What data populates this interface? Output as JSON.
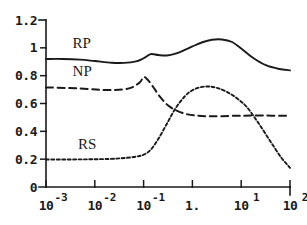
{
  "chart_data": {
    "type": "line",
    "title": "",
    "xlabel": "",
    "ylabel": "",
    "xscale": "log",
    "xlim": [
      0.001,
      100
    ],
    "ylim": [
      0,
      1.2
    ],
    "grid": false,
    "legend_position": "inline-labels",
    "y_ticks": [
      "0",
      "0.2",
      "0.4",
      "0.6",
      "0.8",
      "1",
      "1.2"
    ],
    "y_tick_values": [
      0,
      0.2,
      0.4,
      0.6,
      0.8,
      1,
      1.2
    ],
    "x_ticks": [
      {
        "base": "10",
        "exponent": "-3",
        "value": 0.001
      },
      {
        "base": "10",
        "exponent": "-2",
        "value": 0.01
      },
      {
        "base": "10",
        "exponent": "-1",
        "value": 0.1
      },
      {
        "base": "1.",
        "exponent": "",
        "value": 1
      },
      {
        "base": "10",
        "exponent": "1",
        "value": 10
      },
      {
        "base": "10",
        "exponent": "2",
        "value": 100
      }
    ],
    "series": [
      {
        "name": "RP",
        "style": "solid",
        "label_x": 0.0035,
        "label_y": 1.0,
        "x": [
          0.001,
          0.0022,
          0.005,
          0.01,
          0.022,
          0.04,
          0.07,
          0.1,
          0.14,
          0.2,
          0.3,
          0.45,
          0.7,
          1.0,
          1.6,
          2.5,
          4.0,
          6.5,
          10,
          18,
          32,
          60,
          100
        ],
        "values": [
          0.92,
          0.92,
          0.915,
          0.905,
          0.893,
          0.892,
          0.903,
          0.925,
          0.955,
          0.948,
          0.945,
          0.958,
          0.985,
          1.01,
          1.04,
          1.058,
          1.06,
          1.042,
          0.995,
          0.925,
          0.875,
          0.848,
          0.838
        ]
      },
      {
        "name": "NP",
        "style": "long-dashed",
        "label_x": 0.0035,
        "label_y": 0.8,
        "x": [
          0.001,
          0.0025,
          0.006,
          0.013,
          0.025,
          0.04,
          0.06,
          0.085,
          0.1,
          0.12,
          0.16,
          0.22,
          0.32,
          0.5,
          0.8,
          1.3,
          2.2,
          4.0,
          8.0,
          16,
          35,
          70,
          100
        ],
        "values": [
          0.715,
          0.712,
          0.706,
          0.698,
          0.697,
          0.702,
          0.718,
          0.755,
          0.79,
          0.772,
          0.715,
          0.645,
          0.585,
          0.545,
          0.522,
          0.512,
          0.508,
          0.509,
          0.512,
          0.513,
          0.513,
          0.512,
          0.512
        ]
      },
      {
        "name": "RS",
        "style": "short-dashed",
        "label_x": 0.0045,
        "label_y": 0.275,
        "x": [
          0.001,
          0.003,
          0.008,
          0.02,
          0.04,
          0.07,
          0.1,
          0.14,
          0.2,
          0.3,
          0.45,
          0.7,
          1.0,
          1.5,
          2.2,
          3.2,
          5.0,
          8.0,
          13,
          22,
          38,
          65,
          100
        ],
        "values": [
          0.198,
          0.198,
          0.199,
          0.202,
          0.208,
          0.218,
          0.232,
          0.268,
          0.345,
          0.455,
          0.565,
          0.652,
          0.695,
          0.718,
          0.722,
          0.712,
          0.685,
          0.64,
          0.575,
          0.465,
          0.338,
          0.215,
          0.138
        ]
      }
    ]
  }
}
